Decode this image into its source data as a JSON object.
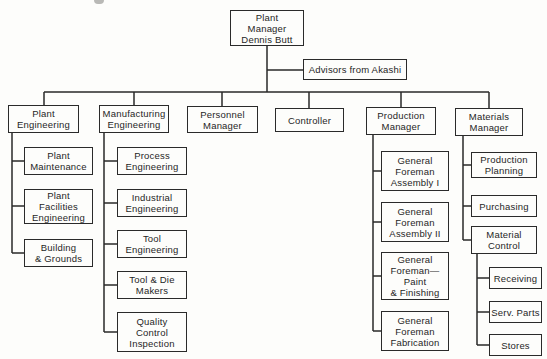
{
  "org": {
    "root": {
      "label": "Plant\nManager\nDennis Butt"
    },
    "advisor": {
      "label": "Advisors from Akashi"
    },
    "departments": [
      {
        "label": "Plant\nEngineering",
        "children": [
          {
            "label": "Plant\nMaintenance"
          },
          {
            "label": "Plant\nFacilities\nEngineering"
          },
          {
            "label": "Building\n& Grounds"
          }
        ]
      },
      {
        "label": "Manufacturing\nEngineering",
        "children": [
          {
            "label": "Process\nEngineering"
          },
          {
            "label": "Industrial\nEngineering"
          },
          {
            "label": "Tool\nEngineering"
          },
          {
            "label": "Tool & Die\nMakers"
          },
          {
            "label": "Quality\nControl\nInspection"
          }
        ]
      },
      {
        "label": "Personnel\nManager",
        "children": []
      },
      {
        "label": "Controller",
        "children": []
      },
      {
        "label": "Production\nManager",
        "children": [
          {
            "label": "General\nForeman\nAssembly I"
          },
          {
            "label": "General\nForeman\nAssembly II"
          },
          {
            "label": "General\nForeman—\nPaint\n& Finishing"
          },
          {
            "label": "General\nForeman\nFabrication"
          }
        ]
      },
      {
        "label": "Materials\nManager",
        "children": [
          {
            "label": "Production\nPlanning"
          },
          {
            "label": "Purchasing"
          },
          {
            "label": "Material\nControl",
            "children": [
              {
                "label": "Receiving"
              },
              {
                "label": "Serv. Parts"
              },
              {
                "label": "Stores"
              }
            ]
          }
        ]
      }
    ]
  }
}
